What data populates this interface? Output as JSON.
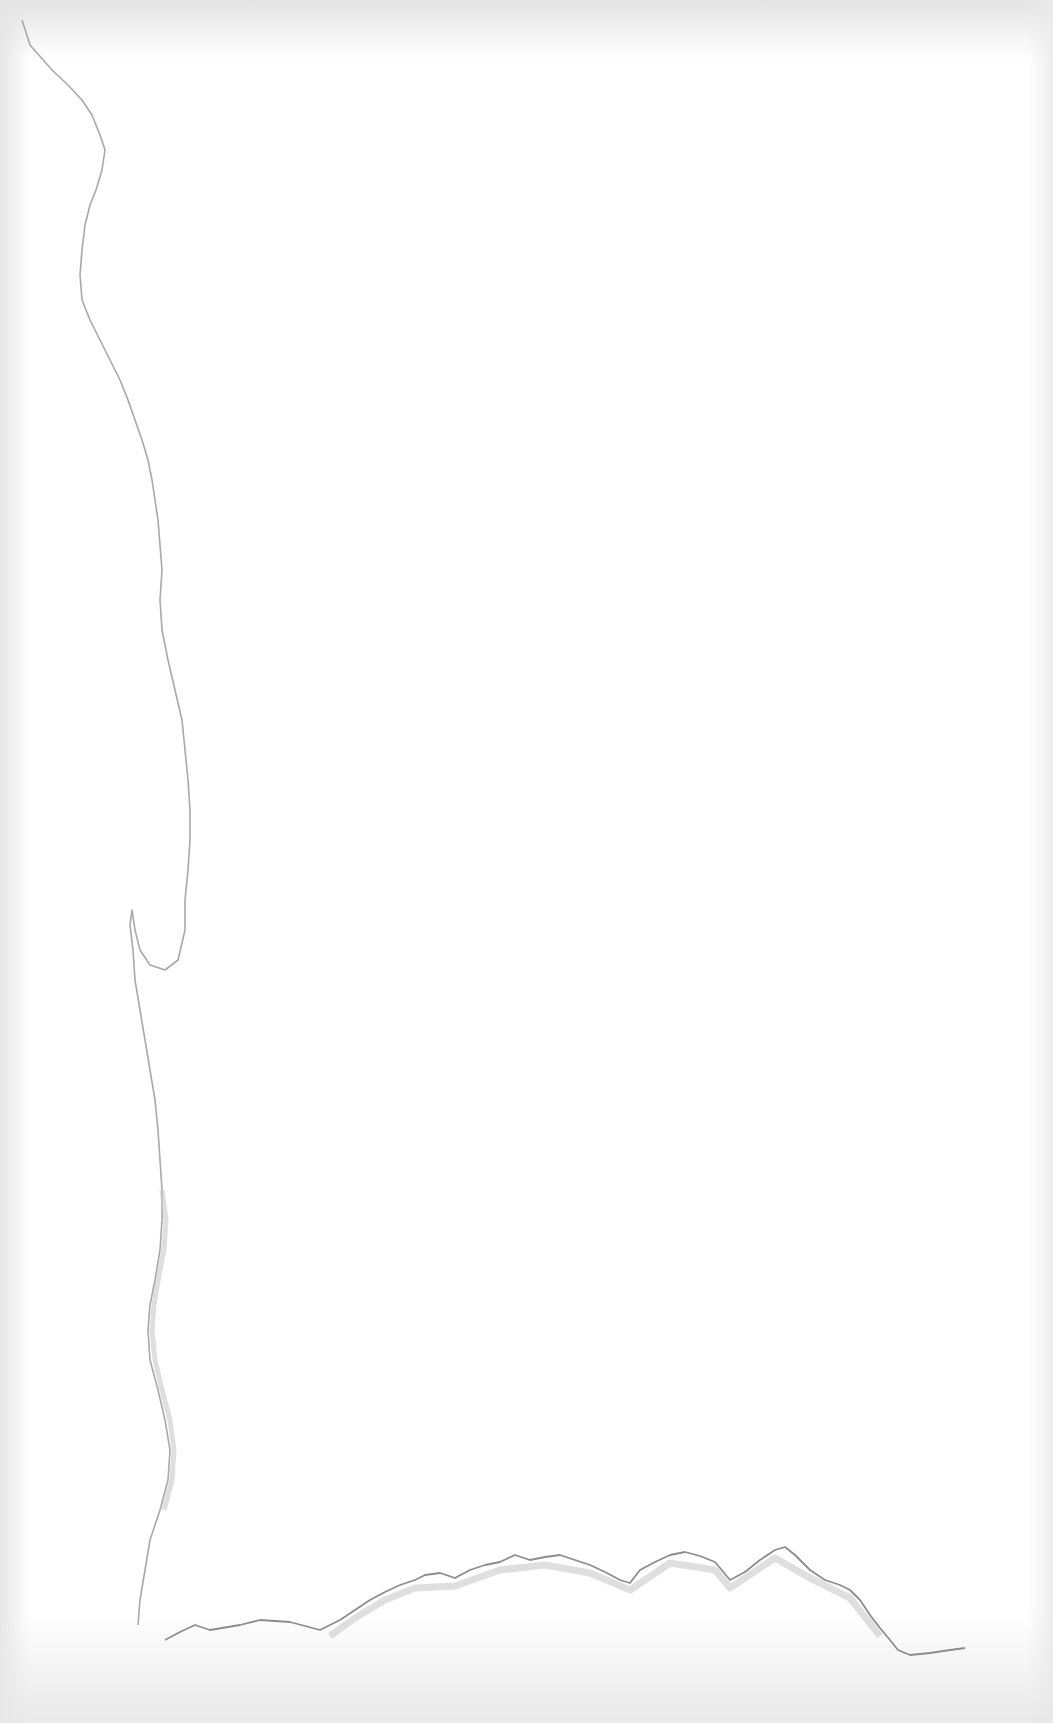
{
  "canvas": {
    "width": 1053,
    "height": 1723,
    "background": "#ffffff"
  },
  "texture": {
    "type": "torn-paper",
    "tear_color": "#9a9a9a",
    "tear_shadow_color": "#c8c8c8",
    "edge_shade_color": "#e2e2e2"
  }
}
